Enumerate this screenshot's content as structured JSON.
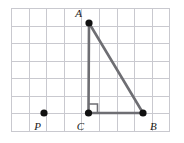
{
  "figure": {
    "background_color": "#ffffff",
    "grid": {
      "line_color": "#c9c9cf",
      "cell_size_px": 17.6,
      "columns": 9,
      "rows": 7,
      "left_px": 11,
      "top_px": 8,
      "right_px": 170,
      "bottom_px": 131
    },
    "segment_color": "#6e6e73",
    "point_color": "#111111",
    "points": [
      {
        "id": "A",
        "label": "A",
        "grid_x": 4.4,
        "grid_y": 0.85,
        "px_x": 89,
        "px_y": 23,
        "label_px_x": 82,
        "label_px_y": 14,
        "label_anchor": "end"
      },
      {
        "id": "B",
        "label": "B",
        "grid_x": 7.5,
        "grid_y": 5.97,
        "px_x": 143,
        "px_y": 113,
        "label_px_x": 150,
        "label_px_y": 128,
        "label_anchor": "start"
      },
      {
        "id": "C",
        "label": "C",
        "grid_x": 4.4,
        "grid_y": 5.97,
        "px_x": 88,
        "px_y": 113,
        "label_px_x": 82,
        "label_px_y": 128,
        "label_anchor": "end"
      },
      {
        "id": "P",
        "label": "P",
        "grid_x": 1.9,
        "grid_y": 5.97,
        "px_x": 44,
        "px_y": 113,
        "label_px_x": 39,
        "label_px_y": 128,
        "label_anchor": "end"
      }
    ],
    "segments": [
      {
        "id": "AC",
        "from": "A",
        "to": "C",
        "label": ""
      },
      {
        "id": "CB",
        "from": "C",
        "to": "B",
        "label": ""
      },
      {
        "id": "AB",
        "from": "A",
        "to": "B",
        "label": ""
      }
    ],
    "right_angle": {
      "at_point": "C",
      "marker_size_px": 9,
      "description": "right-angle square at vertex C between CA and CB"
    }
  }
}
